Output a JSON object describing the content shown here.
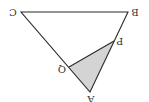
{
  "diagram": {
    "orientation": "rotated 180 degrees",
    "colors": {
      "stroke": "#2a2a2a",
      "shade": "#d4d4d4",
      "label": "#333333",
      "background": "#ffffff"
    },
    "points": {
      "A": {
        "label": "A",
        "x": 90,
        "y": 92
      },
      "B": {
        "label": "B",
        "x": 128,
        "y": 12
      },
      "C": {
        "label": "C",
        "x": 21,
        "y": 12
      },
      "P": {
        "label": "P",
        "x": 114,
        "y": 41
      },
      "Q": {
        "label": "Q",
        "x": 69,
        "y": 67
      }
    },
    "segments": [
      "CB",
      "BA",
      "AC",
      "PQ"
    ],
    "shaded_region": "APQ"
  }
}
